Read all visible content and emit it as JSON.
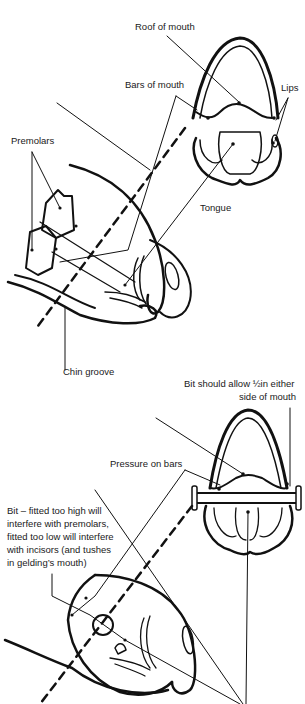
{
  "figure_top": {
    "title": "Horse mouth anatomy",
    "labels": {
      "roof_of_mouth": "Roof of mouth",
      "bars_of_mouth": "Bars of mouth",
      "lips": "Lips",
      "premolars": "Premolars",
      "tongue": "Tongue",
      "chin_groove": "Chin groove"
    }
  },
  "figure_bottom": {
    "title": "Bit fitting",
    "labels": {
      "bit_allowance_line1": "Bit should allow ½in either",
      "bit_allowance_line2": "side of mouth",
      "pressure_on_bars": "Pressure on bars",
      "bit_note_line1": "Bit – fitted too high will",
      "bit_note_line2": "interfere with premolars,",
      "bit_note_line3": "fitted too low will interfere",
      "bit_note_line4": "with incisors (and tushes",
      "bit_note_line5": "in gelding’s mouth)"
    }
  }
}
